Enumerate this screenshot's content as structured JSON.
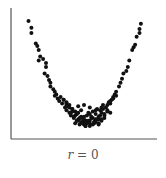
{
  "chart_data": {
    "type": "scatter",
    "title": "",
    "caption": "r = 0",
    "caption_var": "r",
    "caption_rest": " = 0",
    "xlabel": "",
    "ylabel": "",
    "xlim": [
      0,
      100
    ],
    "ylim": [
      0,
      100
    ],
    "grid": false,
    "legend": null,
    "marker_color": "#111111",
    "axis_color": "#555555",
    "series": [
      {
        "name": "points",
        "x": [
          12,
          14,
          14,
          17,
          18,
          19,
          20,
          19,
          22,
          24,
          24,
          23,
          25,
          26,
          27,
          27,
          29,
          30,
          30,
          31,
          32,
          33,
          34,
          35,
          36,
          37,
          38,
          38,
          39,
          40,
          40,
          41,
          42,
          43,
          44,
          44,
          45,
          46,
          46,
          47,
          48,
          48,
          49,
          50,
          50,
          51,
          52,
          52,
          53,
          54,
          54,
          55,
          56,
          56,
          57,
          58,
          58,
          59,
          60,
          60,
          61,
          62,
          62,
          63,
          64,
          64,
          65,
          66,
          67,
          68,
          68,
          69,
          70,
          71,
          72,
          74,
          75,
          76,
          77,
          79,
          80,
          81,
          83,
          84,
          85,
          86,
          88,
          88,
          89,
          36,
          38,
          40,
          42,
          44,
          46,
          48,
          50,
          52,
          54,
          56,
          58,
          60,
          62,
          64,
          66,
          41,
          43,
          45,
          47,
          49,
          51,
          53,
          55,
          57,
          59,
          61,
          63,
          45,
          48,
          51,
          54,
          57,
          60,
          38,
          42,
          46,
          50,
          54,
          58,
          62,
          66,
          68,
          70,
          72
        ],
        "y": [
          90,
          85,
          81,
          73,
          71,
          68,
          63,
          60,
          61,
          58,
          55,
          50,
          48,
          45,
          43,
          40,
          38,
          36,
          33,
          34,
          31,
          29,
          32,
          27,
          30,
          24,
          28,
          22,
          25,
          20,
          26,
          18,
          23,
          16,
          21,
          12,
          19,
          14,
          25,
          11,
          17,
          22,
          13,
          15,
          26,
          10,
          18,
          14,
          20,
          12,
          24,
          16,
          11,
          21,
          13,
          19,
          15,
          23,
          17,
          12,
          22,
          14,
          20,
          26,
          18,
          16,
          24,
          21,
          28,
          27,
          20,
          30,
          32,
          34,
          36,
          40,
          43,
          46,
          50,
          52,
          55,
          60,
          68,
          70,
          72,
          78,
          81,
          84,
          88,
          30,
          27,
          24,
          21,
          18,
          15,
          13,
          11,
          12,
          14,
          16,
          13,
          11,
          15,
          19,
          22,
          20,
          17,
          14,
          16,
          12,
          10,
          14,
          17,
          12,
          15,
          18,
          23,
          19,
          16,
          13,
          10,
          13,
          15,
          26,
          23,
          20,
          17,
          19,
          22,
          24,
          26,
          29,
          31,
          33
        ]
      }
    ]
  }
}
